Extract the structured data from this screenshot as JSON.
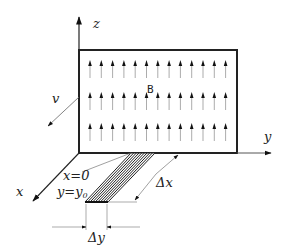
{
  "diagram": {
    "labels": {
      "z_axis": "z",
      "y_axis": "y",
      "x_axis": "x",
      "velocity": "v",
      "field": "B",
      "x_condition": "x=0",
      "y_condition": "y=y",
      "y_subscript": "0",
      "delta_x": "Δx",
      "delta_y": "Δy"
    },
    "field_arrows": {
      "rows": 3,
      "per_row": 13,
      "direction": "up"
    },
    "colors": {
      "stroke": "#222222",
      "field_arrow": "#555555",
      "background": "#ffffff"
    }
  }
}
